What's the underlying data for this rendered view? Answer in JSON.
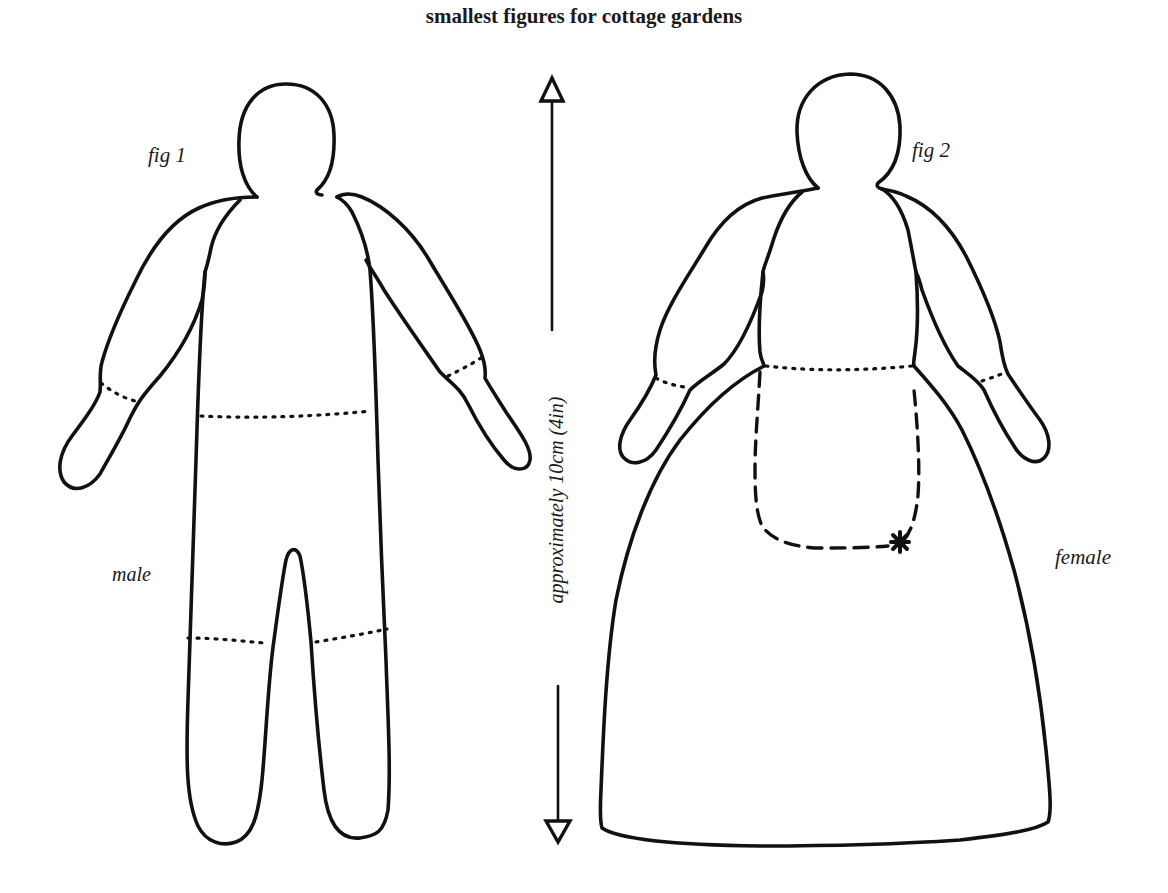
{
  "diagram": {
    "title": "smallest figures for cottage gardens",
    "figures": [
      {
        "id": "fig1",
        "label": "fig 1",
        "gender_label": "male",
        "parts": [
          "head",
          "body",
          "arms",
          "hands",
          "legs",
          "feet"
        ],
        "stitch_lines": [
          "wrist-left",
          "wrist-right",
          "waist",
          "knee-left",
          "knee-right"
        ]
      },
      {
        "id": "fig2",
        "label": "fig 2",
        "gender_label": "female",
        "parts": [
          "head",
          "bodice",
          "arms",
          "hands",
          "skirt",
          "apron"
        ],
        "stitch_lines": [
          "wrist-left",
          "wrist-right",
          "waist",
          "apron-outline"
        ],
        "marker": "*"
      }
    ],
    "measurement": {
      "label": "approximately 10cm (4in)",
      "orientation": "vertical",
      "arrow_up": "open-triangle-arrow",
      "arrow_down": "open-triangle-arrow"
    },
    "colors": {
      "ink": "#111111",
      "paper": "#ffffff"
    }
  }
}
